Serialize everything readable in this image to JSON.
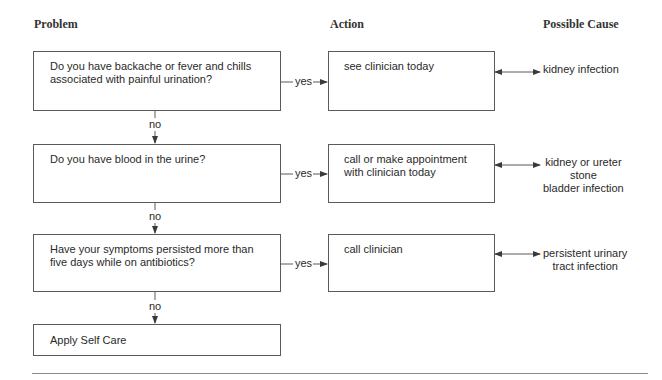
{
  "headers": {
    "problem": "Problem",
    "action": "Action",
    "cause": "Possible Cause"
  },
  "rows": [
    {
      "question": "Do you have backache or fever and chills\nassociated with painful urination?",
      "yes_label": "yes",
      "action": "see clinician today",
      "cause": "kidney infection",
      "no_label": "no"
    },
    {
      "question": "Do you have blood in the urine?",
      "yes_label": "yes",
      "action": "call or make appointment\nwith clinician today",
      "cause": "kidney or ureter\nstone\nbladder infection",
      "no_label": "no"
    },
    {
      "question": "Have your symptoms persisted more than\nfive days while on antibiotics?",
      "yes_label": "yes",
      "action": "call clinician",
      "cause": "persistent urinary\ntract infection",
      "no_label": "no"
    }
  ],
  "final": {
    "label": "Apply Self Care"
  },
  "colors": {
    "line": "#5a5a5a",
    "text": "#2a2a2a"
  }
}
